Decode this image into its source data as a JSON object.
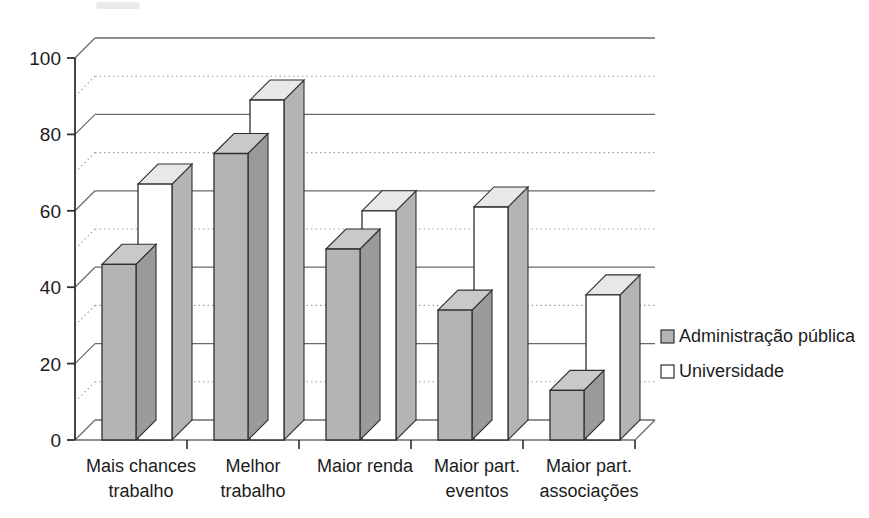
{
  "chart_data": {
    "type": "bar",
    "title": "",
    "subtitle": "",
    "xlabel": "",
    "ylabel": "",
    "ylim": [
      0,
      100
    ],
    "ytick_labels": [
      "0",
      "20",
      "40",
      "60",
      "80",
      "100"
    ],
    "ytick_values": [
      0,
      20,
      40,
      60,
      80,
      100
    ],
    "minor_gridline_values": [
      10,
      30,
      50,
      70,
      90
    ],
    "grid": true,
    "grid_style": "major solid, minor dotted",
    "three_d": true,
    "legend_position": "right",
    "categories": [
      "Mais chances trabalho",
      "Melhor trabalho",
      "Maior renda",
      "Maior part. eventos",
      "Maior part. associações"
    ],
    "category_lines": [
      [
        "Mais chances",
        "trabalho"
      ],
      [
        "Melhor",
        "trabalho"
      ],
      [
        "Maior renda",
        ""
      ],
      [
        "Maior part.",
        "eventos"
      ],
      [
        "Maior part.",
        "associações"
      ]
    ],
    "series": [
      {
        "name": "Administração pública",
        "color": "#b4b4b4",
        "values": [
          46,
          75,
          50,
          34,
          13
        ]
      },
      {
        "name": "Universidade",
        "color": "#ffffff",
        "values": [
          67,
          89,
          60,
          61,
          38
        ]
      }
    ]
  },
  "legend": {
    "items": [
      {
        "label": "Administração pública",
        "swatch": "#b4b4b4"
      },
      {
        "label": "Universidade",
        "swatch": "#ffffff"
      }
    ]
  },
  "axis": {
    "y_labels": [
      "100",
      "80",
      "60",
      "40",
      "20",
      "0"
    ]
  },
  "colors": {
    "bar_gray_face": "#b4b4b4",
    "bar_gray_side": "#9a9a9a",
    "bar_gray_top": "#c9c9c9",
    "bar_white_face": "#ffffff",
    "bar_white_side": "#b4b4b4",
    "bar_white_top": "#e8e8e8",
    "outline": "#303030",
    "gridline_major": "#6b6b6b",
    "gridline_minor": "#9e9e9e",
    "text": "#1c1c1c"
  }
}
